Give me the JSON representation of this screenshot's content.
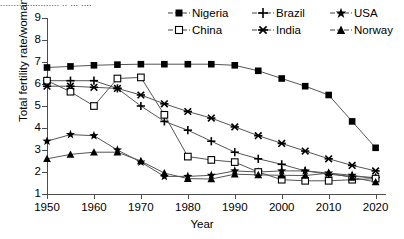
{
  "top_cut_text": "...................... .. ... ....",
  "axes": {
    "ylabel": "Total fertility rate/woman",
    "xlabel": "Year",
    "yticks": [
      "1",
      "2",
      "3",
      "4",
      "5",
      "6",
      "7",
      "8",
      "9"
    ],
    "xticks": [
      "1950",
      "1960",
      "1970",
      "1980",
      "1990",
      "2000",
      "2010",
      "2020"
    ]
  },
  "legend": {
    "row1": [
      {
        "label": "Nigeria",
        "marker": "filled-square-icon"
      },
      {
        "label": "Brazil",
        "marker": "plus-icon"
      },
      {
        "label": "USA",
        "marker": "filled-star-icon"
      }
    ],
    "row2": [
      {
        "label": "China",
        "marker": "open-square-icon"
      },
      {
        "label": "India",
        "marker": "cross-star-icon"
      },
      {
        "label": "Norway",
        "marker": "filled-triangle-icon"
      }
    ]
  },
  "chart_data": {
    "type": "line",
    "title": "",
    "xlabel": "Year",
    "ylabel": "Total fertility rate/woman",
    "xlim": [
      1950,
      2022
    ],
    "ylim": [
      1,
      9
    ],
    "grid": false,
    "legend_position": "top-right",
    "x": [
      1950,
      1955,
      1960,
      1965,
      1970,
      1975,
      1980,
      1985,
      1990,
      1995,
      2000,
      2005,
      2010,
      2015,
      2020
    ],
    "series": [
      {
        "name": "Nigeria",
        "marker": "filled-square",
        "values": [
          6.75,
          6.8,
          6.85,
          6.88,
          6.9,
          6.9,
          6.9,
          6.9,
          6.85,
          6.6,
          6.25,
          5.9,
          5.5,
          4.3,
          3.1
        ]
      },
      {
        "name": "Brazil",
        "marker": "plus",
        "values": [
          6.15,
          6.15,
          6.15,
          5.8,
          5.0,
          4.3,
          3.9,
          3.4,
          2.9,
          2.6,
          2.35,
          2.05,
          1.9,
          1.8,
          1.75
        ]
      },
      {
        "name": "USA",
        "marker": "filled-star",
        "values": [
          3.4,
          3.7,
          3.65,
          3.0,
          2.45,
          1.8,
          1.8,
          1.85,
          2.05,
          2.0,
          2.05,
          2.05,
          1.95,
          1.85,
          1.7
        ]
      },
      {
        "name": "China",
        "marker": "open-square",
        "values": [
          6.15,
          5.65,
          5.0,
          6.25,
          6.3,
          4.6,
          2.7,
          2.55,
          2.45,
          2.0,
          1.65,
          1.6,
          1.6,
          1.65,
          1.7
        ]
      },
      {
        "name": "India",
        "marker": "cross-star",
        "values": [
          5.9,
          5.9,
          5.85,
          5.8,
          5.5,
          5.1,
          4.75,
          4.45,
          4.05,
          3.65,
          3.3,
          2.95,
          2.6,
          2.3,
          2.05
        ]
      },
      {
        "name": "Norway",
        "marker": "filled-triangle",
        "values": [
          2.6,
          2.8,
          2.9,
          2.9,
          2.5,
          1.95,
          1.7,
          1.68,
          1.9,
          1.87,
          1.85,
          1.84,
          1.95,
          1.75,
          1.55
        ]
      }
    ]
  }
}
